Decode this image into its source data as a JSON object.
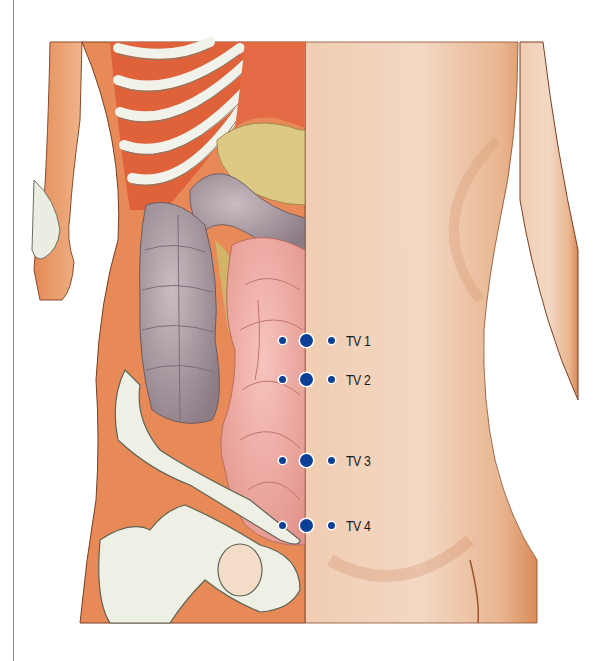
{
  "illustration": {
    "subject": "anatomical illustration of lower torso: left half shows ribs, colon, small intestine and pelvis; right half shows skin",
    "points": [
      {
        "label": "TV 1",
        "y": 341
      },
      {
        "label": "TV 2",
        "y": 380
      },
      {
        "label": "TV 3",
        "y": 461
      },
      {
        "label": "TV 4",
        "y": 526
      }
    ],
    "colors": {
      "dot": "#0d3f96",
      "skin": "#e8b48e",
      "muscle": "#e0623a",
      "colon": "#9c8c94",
      "intestine": "#eaa49c",
      "bone": "#eef0e6",
      "fat": "#d8c578"
    }
  }
}
